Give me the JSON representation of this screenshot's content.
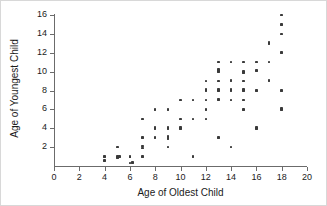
{
  "chart_data": {
    "type": "scatter",
    "title": "",
    "xlabel": "Age of Oldest Child",
    "ylabel": "Age of Youngest Child",
    "xlim": [
      0,
      20
    ],
    "ylim": [
      0,
      16
    ],
    "xticks": [
      0,
      2,
      4,
      6,
      8,
      10,
      12,
      14,
      16,
      18,
      20
    ],
    "yticks": [
      2,
      4,
      6,
      8,
      10,
      12,
      14,
      16
    ],
    "xtick_labels": [
      "0",
      "2",
      "4",
      "6",
      "8",
      "10",
      "12",
      "14",
      "16",
      "18",
      "20"
    ],
    "ytick_labels": [
      "2",
      "4",
      "6",
      "8",
      "10",
      "12",
      "14",
      "16"
    ],
    "grid": false,
    "legend": false,
    "marker": "square",
    "marker_color": "#3a3a3a",
    "points": [
      [
        4,
        1
      ],
      [
        4,
        0.6
      ],
      [
        5,
        2
      ],
      [
        5,
        1
      ],
      [
        5,
        0.9
      ],
      [
        5.2,
        1
      ],
      [
        6,
        1
      ],
      [
        6,
        0.95
      ],
      [
        6,
        0.3
      ],
      [
        6.2,
        0.4
      ],
      [
        7,
        5
      ],
      [
        7,
        3
      ],
      [
        7,
        2.1
      ],
      [
        7,
        1.9
      ],
      [
        7,
        1
      ],
      [
        8,
        6
      ],
      [
        8,
        4
      ],
      [
        8,
        4.1
      ],
      [
        8,
        3
      ],
      [
        9,
        6
      ],
      [
        9,
        4
      ],
      [
        9,
        4.1
      ],
      [
        9,
        3.1
      ],
      [
        9,
        2.9
      ],
      [
        9,
        2
      ],
      [
        10,
        5
      ],
      [
        10,
        4
      ],
      [
        10,
        4.1
      ],
      [
        10,
        7
      ],
      [
        11,
        7
      ],
      [
        11,
        5
      ],
      [
        11,
        1
      ],
      [
        12,
        9
      ],
      [
        12,
        8
      ],
      [
        12,
        8.1
      ],
      [
        12,
        7
      ],
      [
        12,
        6
      ],
      [
        12,
        5
      ],
      [
        12,
        8.05
      ],
      [
        13,
        11
      ],
      [
        13,
        10.2
      ],
      [
        13,
        10
      ],
      [
        13,
        9
      ],
      [
        13,
        8
      ],
      [
        13,
        8.1
      ],
      [
        13,
        7.1
      ],
      [
        13,
        7
      ],
      [
        13,
        3
      ],
      [
        14,
        11
      ],
      [
        14,
        9.1
      ],
      [
        14,
        9
      ],
      [
        14,
        8
      ],
      [
        14,
        8.1
      ],
      [
        14,
        7
      ],
      [
        14,
        2
      ],
      [
        15,
        11
      ],
      [
        15,
        10
      ],
      [
        15,
        9.9
      ],
      [
        15,
        9
      ],
      [
        15,
        8.1
      ],
      [
        15,
        8
      ],
      [
        15,
        7
      ],
      [
        15,
        6
      ],
      [
        16,
        11
      ],
      [
        16,
        10.1
      ],
      [
        16,
        8
      ],
      [
        16,
        4
      ],
      [
        16,
        4.1
      ],
      [
        17,
        13
      ],
      [
        17,
        13.1
      ],
      [
        17,
        11
      ],
      [
        17,
        9
      ],
      [
        17,
        9.1
      ],
      [
        18,
        16
      ],
      [
        18,
        15
      ],
      [
        18,
        14
      ],
      [
        18,
        12
      ],
      [
        18,
        8
      ],
      [
        18,
        6
      ],
      [
        18,
        6.1
      ]
    ]
  }
}
